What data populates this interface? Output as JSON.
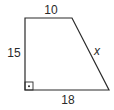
{
  "diagram": {
    "shape": "right trapezoid",
    "labels": {
      "top": "10",
      "left": "15",
      "slant": "x",
      "bottom": "18"
    },
    "right_angle_marker": "bottom-left",
    "colors": {
      "stroke": "#2a2a2a",
      "background": "#ffffff"
    }
  }
}
